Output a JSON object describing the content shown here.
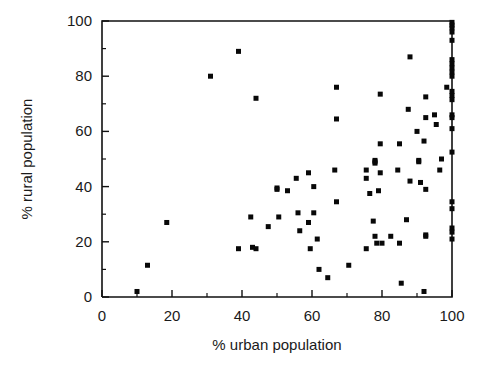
{
  "chart_data": {
    "type": "scatter",
    "title": "",
    "xlabel": "% urban population",
    "ylabel": "% rural population",
    "xlim": [
      0,
      100
    ],
    "ylim": [
      0,
      100
    ],
    "xticks": [
      0,
      20,
      40,
      60,
      80,
      100
    ],
    "yticks": [
      0,
      20,
      40,
      60,
      80,
      100
    ],
    "xtick_labels": [
      "0",
      "20",
      "40",
      "60",
      "80",
      "100"
    ],
    "ytick_labels": [
      "0",
      "20",
      "40",
      "60",
      "80",
      "100"
    ],
    "minor_ticks": true,
    "grid": false,
    "legend": null,
    "marker": "square",
    "marker_color": "#080808",
    "marker_size": 5,
    "n_points": 104,
    "points": [
      [
        10.0,
        2.0
      ],
      [
        13.0,
        11.5
      ],
      [
        18.5,
        27.0
      ],
      [
        31.0,
        80.0
      ],
      [
        39.0,
        89.0
      ],
      [
        39.0,
        17.5
      ],
      [
        42.5,
        29.0
      ],
      [
        43.0,
        18.0
      ],
      [
        44.0,
        72.0
      ],
      [
        44.0,
        17.5
      ],
      [
        47.5,
        25.5
      ],
      [
        50.0,
        39.5
      ],
      [
        50.0,
        39.0
      ],
      [
        50.5,
        29.0
      ],
      [
        53.0,
        38.5
      ],
      [
        55.5,
        43.0
      ],
      [
        56.0,
        30.5
      ],
      [
        56.5,
        24.0
      ],
      [
        59.0,
        45.0
      ],
      [
        59.0,
        27.0
      ],
      [
        59.5,
        17.5
      ],
      [
        60.5,
        40.0
      ],
      [
        60.5,
        30.5
      ],
      [
        61.5,
        21.0
      ],
      [
        62.0,
        10.0
      ],
      [
        64.5,
        7.0
      ],
      [
        66.5,
        46.0
      ],
      [
        67.0,
        76.0
      ],
      [
        67.0,
        64.5
      ],
      [
        67.0,
        34.5
      ],
      [
        70.5,
        11.5
      ],
      [
        75.5,
        46.0
      ],
      [
        75.5,
        43.0
      ],
      [
        75.5,
        17.5
      ],
      [
        76.5,
        37.5
      ],
      [
        77.5,
        27.5
      ],
      [
        78.0,
        49.5
      ],
      [
        78.0,
        49.0
      ],
      [
        78.0,
        48.5
      ],
      [
        78.0,
        22.0
      ],
      [
        78.5,
        19.5
      ],
      [
        79.0,
        38.5
      ],
      [
        79.5,
        73.5
      ],
      [
        79.5,
        55.5
      ],
      [
        79.5,
        45.0
      ],
      [
        80.0,
        19.5
      ],
      [
        82.5,
        22.0
      ],
      [
        84.5,
        46.0
      ],
      [
        85.0,
        55.5
      ],
      [
        85.0,
        19.5
      ],
      [
        85.5,
        5.0
      ],
      [
        87.0,
        28.0
      ],
      [
        87.5,
        68.0
      ],
      [
        88.0,
        87.0
      ],
      [
        88.0,
        42.0
      ],
      [
        90.0,
        60.0
      ],
      [
        90.5,
        49.5
      ],
      [
        90.5,
        49.0
      ],
      [
        91.0,
        41.5
      ],
      [
        92.0,
        56.5
      ],
      [
        92.5,
        65.0
      ],
      [
        92.5,
        72.5
      ],
      [
        92.5,
        39.0
      ],
      [
        92.5,
        22.5
      ],
      [
        92.5,
        22.0
      ],
      [
        92.0,
        2.0
      ],
      [
        95.0,
        66.0
      ],
      [
        95.5,
        62.5
      ],
      [
        96.5,
        46.0
      ],
      [
        97.0,
        50.0
      ],
      [
        98.5,
        76.0
      ],
      [
        100.0,
        99.5
      ],
      [
        100.0,
        98.5
      ],
      [
        100.0,
        97.5
      ],
      [
        100.0,
        96.0
      ],
      [
        100.0,
        93.0
      ],
      [
        100.0,
        86.0
      ],
      [
        100.0,
        84.5
      ],
      [
        100.0,
        83.0
      ],
      [
        100.0,
        81.5
      ],
      [
        100.0,
        80.0
      ],
      [
        100.0,
        74.5
      ],
      [
        100.0,
        73.0
      ],
      [
        100.0,
        71.5
      ],
      [
        100.0,
        66.0
      ],
      [
        100.0,
        65.0
      ],
      [
        100.0,
        61.0
      ],
      [
        100.0,
        52.5
      ],
      [
        100.0,
        34.5
      ],
      [
        100.0,
        32.0
      ],
      [
        100.0,
        25.0
      ],
      [
        100.0,
        23.5
      ],
      [
        100.0,
        21.0
      ]
    ]
  },
  "axes": {
    "x_axis_name": "x-axis",
    "y_axis_name": "y-axis"
  }
}
